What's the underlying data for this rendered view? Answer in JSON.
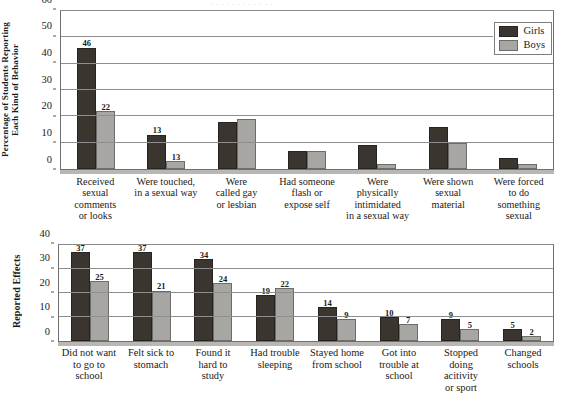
{
  "top_strip_text": "· · · · · · · · · · · ·",
  "legend": {
    "girls_label": "Girls",
    "boys_label": "Boys",
    "girls_color": "#3b3530",
    "boys_color": "#a8a6a3"
  },
  "chart_data": [
    {
      "type": "bar",
      "title": "",
      "ylabel": "Percentage of Students Reporting\nEach Kind of Behavior",
      "ylabel_line1": "Percentage of Students Reporting",
      "ylabel_line2": "Each Kind of Behavior",
      "xlabel": "",
      "ylim": [
        0,
        60
      ],
      "yticks": [
        0,
        10,
        20,
        30,
        40,
        50,
        60
      ],
      "grid": true,
      "legend_position": "top-right",
      "categories": [
        "Received\nsexual\ncomments\nor looks",
        "Were touched,\nin a sexual way",
        "Were\ncalled gay\nor lesbian",
        "Had someone\nflash or\nexpose self",
        "Were\nphysically\nintimidated\nin a sexual way",
        "Were shown\nsexual\nmaterial",
        "Were forced\nto do\nsomething\nsexual"
      ],
      "series": [
        {
          "name": "Girls",
          "color": "#3b3530",
          "values": [
            46,
            13,
            18,
            7,
            9,
            16,
            4
          ],
          "labels": [
            "46",
            "13",
            "",
            "",
            "",
            "",
            ""
          ]
        },
        {
          "name": "Boys",
          "color": "#a8a6a3",
          "values": [
            22,
            3,
            19,
            7,
            2,
            10,
            2
          ],
          "labels": [
            "22",
            "13",
            "",
            "",
            "",
            "",
            ""
          ]
        }
      ]
    },
    {
      "type": "bar",
      "title": "",
      "ylabel": "Reported Effects",
      "xlabel": "",
      "ylim": [
        0,
        40
      ],
      "yticks": [
        0,
        10,
        20,
        30,
        40
      ],
      "grid": true,
      "legend_position": "none",
      "categories": [
        "Did not want\nto go to\nschool",
        "Felt sick to\nstomach",
        "Found it\nhard to\nstudy",
        "Had trouble\nsleeping",
        "Stayed home\nfrom school",
        "Got into\ntrouble at\nschool",
        "Stopped\ndoing\nacitivity\nor sport",
        "Changed\nschools"
      ],
      "series": [
        {
          "name": "Girls",
          "color": "#3b3530",
          "values": [
            37,
            37,
            34,
            19,
            14,
            10,
            9,
            5
          ],
          "labels": [
            "37",
            "37",
            "34",
            "19",
            "14",
            "10",
            "9",
            "5"
          ]
        },
        {
          "name": "Boys",
          "color": "#a8a6a3",
          "values": [
            25,
            21,
            24,
            22,
            9,
            7,
            5,
            2
          ],
          "labels": [
            "25",
            "21",
            "24",
            "22",
            "9",
            "7",
            "5",
            "2"
          ]
        }
      ]
    }
  ]
}
